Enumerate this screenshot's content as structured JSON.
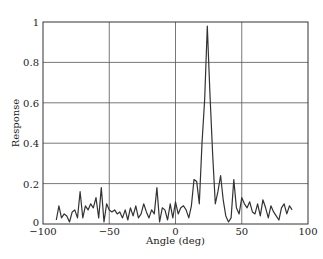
{
  "chart_data": {
    "type": "line",
    "title": "",
    "xlabel": "Angle (deg)",
    "ylabel": "Response",
    "xlim": [
      -100,
      100
    ],
    "ylim": [
      0,
      1
    ],
    "grid": true,
    "legend": null,
    "x_ticks": [
      -100,
      -50,
      0,
      50,
      100
    ],
    "x_tick_labels": [
      "−100",
      "−50",
      "0",
      "50",
      "100"
    ],
    "y_ticks": [
      0,
      0.2,
      0.4,
      0.6,
      0.8,
      1
    ],
    "y_tick_labels": [
      "0",
      "0.2",
      "0.4",
      "0.6",
      "0.8",
      "1"
    ],
    "series": [
      {
        "name": "Response",
        "color": "#333333",
        "x": [
          -90,
          -88,
          -86,
          -84,
          -82,
          -80,
          -78,
          -76,
          -74,
          -72,
          -70,
          -68,
          -66,
          -64,
          -62,
          -60,
          -58,
          -56,
          -54,
          -52,
          -50,
          -48,
          -46,
          -44,
          -42,
          -40,
          -38,
          -36,
          -34,
          -32,
          -30,
          -28,
          -26,
          -24,
          -22,
          -20,
          -18,
          -16,
          -14,
          -12,
          -10,
          -8,
          -6,
          -4,
          -2,
          0,
          2,
          4,
          6,
          8,
          10,
          12,
          14,
          16,
          18,
          20,
          22,
          24,
          26,
          28,
          30,
          32,
          34,
          36,
          38,
          40,
          42,
          44,
          46,
          48,
          50,
          52,
          54,
          56,
          58,
          60,
          62,
          64,
          66,
          68,
          70,
          72,
          74,
          76,
          78,
          80,
          82,
          84,
          86,
          88
        ],
        "y": [
          0.02,
          0.09,
          0.03,
          0.05,
          0.04,
          0.01,
          0.06,
          0.07,
          0.03,
          0.16,
          0.03,
          0.09,
          0.07,
          0.1,
          0.08,
          0.13,
          0.03,
          0.18,
          0.01,
          0.1,
          0.07,
          0.06,
          0.07,
          0.05,
          0.06,
          0.03,
          0.07,
          0.02,
          0.08,
          0.04,
          0.09,
          0.03,
          0.05,
          0.1,
          0.06,
          0.03,
          0.07,
          0.05,
          0.18,
          0.01,
          0.08,
          0.07,
          0.02,
          0.1,
          0.03,
          0.11,
          0.05,
          0.08,
          0.09,
          0.07,
          0.03,
          0.09,
          0.22,
          0.21,
          0.1,
          0.4,
          0.62,
          0.98,
          0.65,
          0.35,
          0.1,
          0.16,
          0.24,
          0.12,
          0.04,
          0.01,
          0.03,
          0.22,
          0.08,
          0.05,
          0.13,
          0.1,
          0.08,
          0.11,
          0.06,
          0.05,
          0.1,
          0.04,
          0.12,
          0.08,
          0.03,
          0.09,
          0.06,
          0.04,
          0.02,
          0.08,
          0.1,
          0.05,
          0.09,
          0.07
        ]
      }
    ]
  }
}
